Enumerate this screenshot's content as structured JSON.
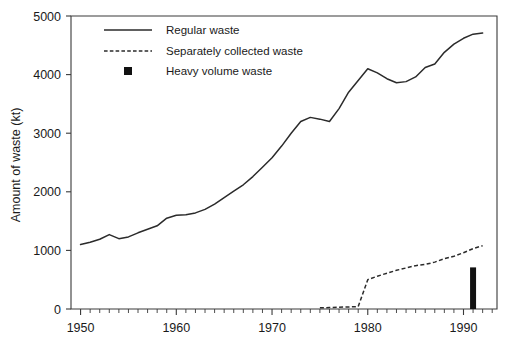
{
  "chart_data": {
    "type": "line",
    "title": "",
    "xlabel": "",
    "ylabel": "Amount of waste (kt)",
    "xlim": [
      1949,
      1993.5
    ],
    "ylim": [
      0,
      5000
    ],
    "grid": false,
    "legend_position": "top-left-inside",
    "y_ticks": [
      0,
      1000,
      2000,
      3000,
      4000,
      5000
    ],
    "y_tick_labels": [
      "0",
      "1000",
      "2000",
      "3000",
      "4000",
      "5000"
    ],
    "x_ticks": [
      1950,
      1960,
      1970,
      1980,
      1990
    ],
    "x_tick_labels": [
      "1950",
      "1960",
      "1970",
      "1980",
      "1990"
    ],
    "x_minor_tick_step": 1,
    "series": [
      {
        "name": "Regular waste",
        "style": "solid",
        "color": "#2b2b2b",
        "x": [
          1950,
          1951,
          1952,
          1953,
          1954,
          1955,
          1956,
          1957,
          1958,
          1959,
          1960,
          1961,
          1962,
          1963,
          1964,
          1965,
          1966,
          1967,
          1968,
          1969,
          1970,
          1971,
          1972,
          1973,
          1974,
          1975,
          1976,
          1977,
          1978,
          1979,
          1980,
          1981,
          1982,
          1983,
          1984,
          1985,
          1986,
          1987,
          1988,
          1989,
          1990,
          1991,
          1992
        ],
        "values": [
          1100,
          1140,
          1190,
          1270,
          1200,
          1230,
          1300,
          1360,
          1420,
          1550,
          1600,
          1610,
          1640,
          1700,
          1790,
          1900,
          2010,
          2120,
          2260,
          2420,
          2580,
          2780,
          3000,
          3200,
          3270,
          3240,
          3200,
          3420,
          3700,
          3900,
          4100,
          4030,
          3930,
          3860,
          3880,
          3960,
          4120,
          4180,
          4380,
          4520,
          4620,
          4690,
          4710
        ]
      },
      {
        "name": "Separately collected waste",
        "style": "dashed",
        "color": "#2b2b2b",
        "x": [
          1975,
          1976,
          1977,
          1978,
          1979,
          1980,
          1981,
          1982,
          1983,
          1984,
          1985,
          1986,
          1987,
          1988,
          1989,
          1990,
          1991,
          1992
        ],
        "values": [
          20,
          25,
          30,
          35,
          40,
          500,
          560,
          610,
          660,
          700,
          740,
          760,
          800,
          860,
          900,
          960,
          1030,
          1080
        ]
      },
      {
        "name": "Heavy volume waste",
        "style": "bar",
        "color": "#111111",
        "x": [
          1991
        ],
        "values": [
          710
        ]
      }
    ],
    "legend": [
      {
        "label": "Regular waste",
        "marker": "solid-line"
      },
      {
        "label": "Separately collected waste",
        "marker": "dashed-line"
      },
      {
        "label": "Heavy volume waste",
        "marker": "filled-square"
      }
    ]
  }
}
